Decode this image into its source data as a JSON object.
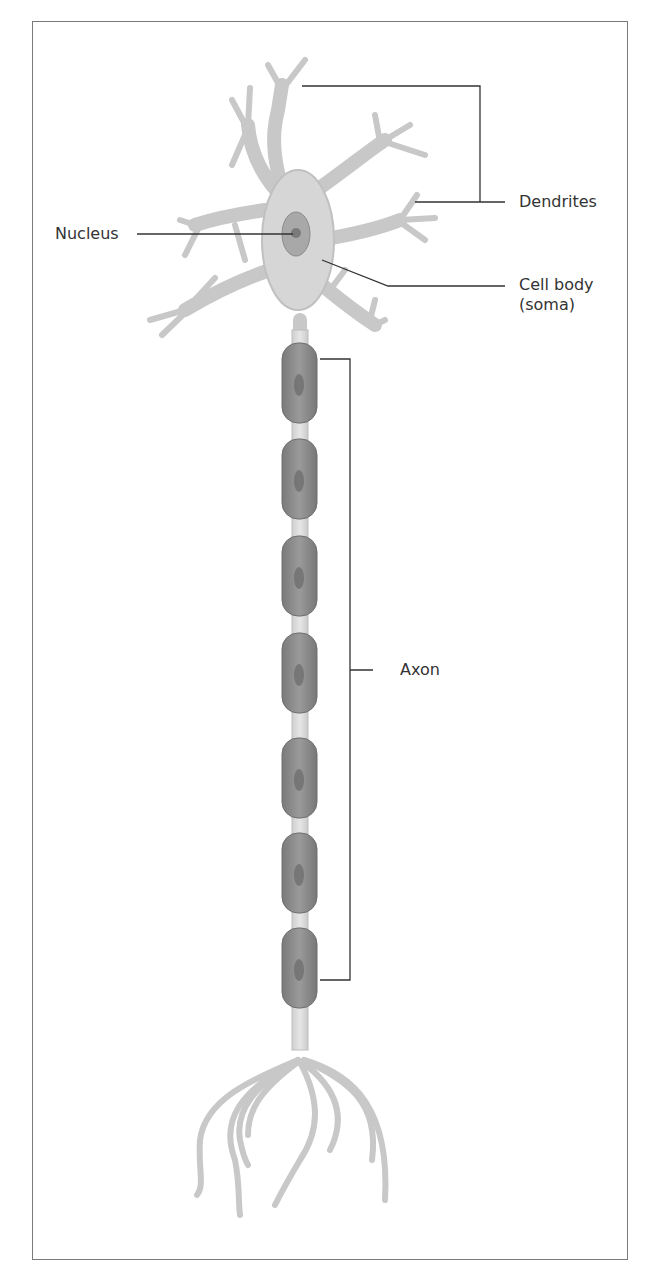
{
  "figure": {
    "labels": {
      "dendrites": "Dendrites",
      "nucleus": "Nucleus",
      "cell_body_line1": "Cell body",
      "cell_body_line2": "(soma)",
      "axon": "Axon"
    },
    "myelin_segment_count": 7,
    "colors": {
      "neuron_fill": "#d9d9d9",
      "neuron_stroke": "#b5b5b5",
      "myelin_fill": "#8c8c8c",
      "nucleus_fill": "#a0a0a0",
      "leader_line": "#333333",
      "frame": "#7a7a7a"
    }
  }
}
